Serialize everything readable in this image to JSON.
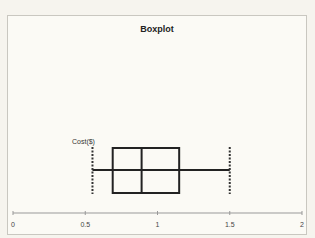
{
  "chart_data": {
    "type": "boxplot",
    "title": "Boxplot",
    "category": "Cost($)",
    "xlabel": "",
    "ylabel": "",
    "xlim": [
      0,
      2
    ],
    "x_ticks": [
      "0",
      "0.5",
      "1",
      "1.5",
      "2"
    ],
    "grid": false,
    "legend": "none",
    "series": [
      {
        "name": "Cost($)",
        "min": 0.55,
        "q1": 0.69,
        "median": 0.89,
        "q3": 1.15,
        "max": 1.5
      }
    ]
  },
  "colors": {
    "line": "#222222",
    "background": "#fbfaf5",
    "border": "#c9c7c0"
  }
}
